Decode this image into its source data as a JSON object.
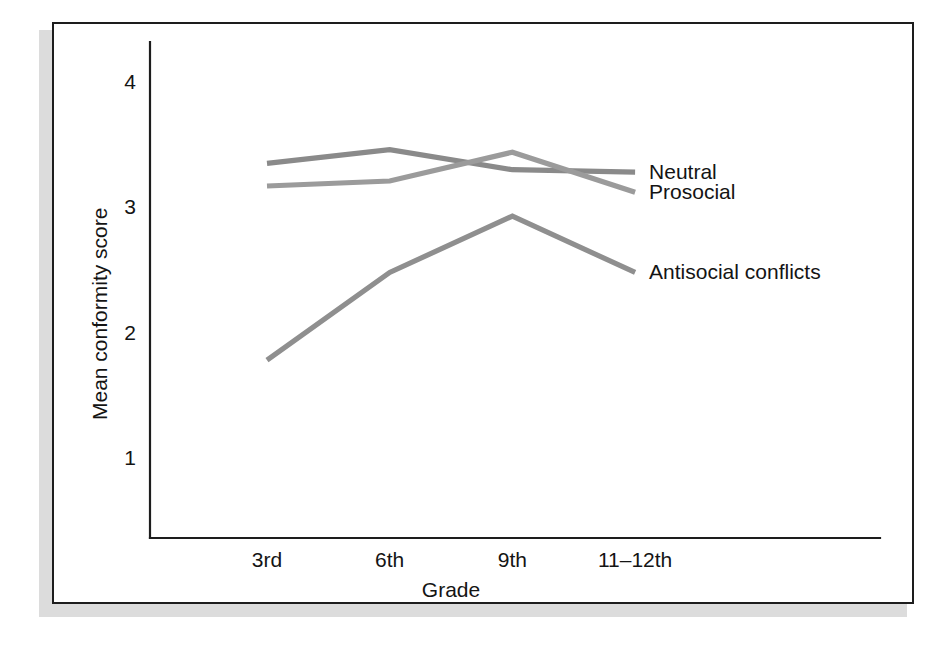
{
  "figure": {
    "frame_color": "#1d1d1d",
    "shadow_color": "#dcdcdc",
    "background": "#ffffff"
  },
  "chart_data": {
    "type": "line",
    "title": "",
    "subtitle": "",
    "xlabel": "Grade",
    "ylabel": "Mean conformity score",
    "categories": [
      "3rd",
      "6th",
      "9th",
      "11–12th"
    ],
    "ytick_labels": [
      "4",
      "3",
      "2",
      "1"
    ],
    "ytick_values": [
      4,
      3,
      2,
      1
    ],
    "ylim": [
      0.55,
      4.35
    ],
    "grid": false,
    "legend_position": "inline-right-of-line-ends",
    "series": [
      {
        "name": "Neutral",
        "label": "Neutral",
        "color": "#8a8a8a",
        "values": [
          3.35,
          3.46,
          3.3,
          3.28
        ]
      },
      {
        "name": "Prosocial",
        "label": "Prosocial",
        "color": "#9b9b9b",
        "values": [
          3.17,
          3.21,
          3.44,
          3.12
        ]
      },
      {
        "name": "Antisocial conflicts",
        "label": "Antisocial conflicts",
        "color": "#8f8f8f",
        "values": [
          1.78,
          2.48,
          2.93,
          2.48
        ]
      }
    ]
  }
}
